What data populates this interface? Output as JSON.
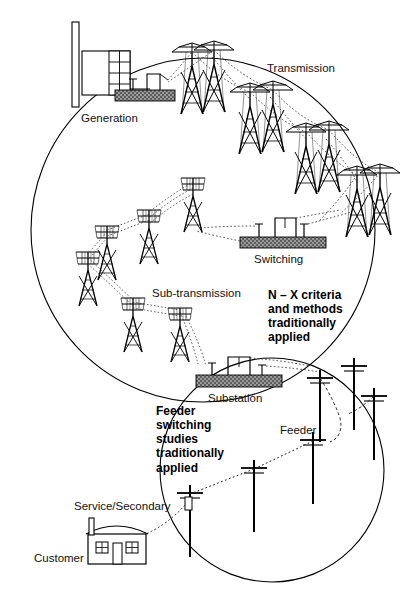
{
  "diagram": {
    "title_absent": true,
    "type": "electric-power-system-hierarchy",
    "labels": {
      "generation": "Generation",
      "transmission": "Transmission",
      "switching": "Switching",
      "sub_transmission": "Sub-transmission",
      "substation": "Substation",
      "feeder": "Feeder",
      "service_secondary": "Service/Secondary",
      "customer": "Customer"
    },
    "callouts": {
      "bulk": "N – X criteria\nand methods\ntraditionally\napplied",
      "distribution": "Feeder\nswitching\nstudies\ntraditionally\napplied"
    },
    "regions": [
      {
        "name": "bulk-power-system-circle",
        "cx": 203,
        "cy": 230,
        "r": 172
      },
      {
        "name": "distribution-system-circle",
        "cx": 272,
        "cy": 470,
        "r": 112
      }
    ],
    "icons": {
      "power_plant": "power-plant-icon",
      "transmission_tower": "transmission-tower-icon",
      "subtransmission_tower": "subtransmission-tower-icon",
      "switching_station": "switching-station-icon",
      "substation": "substation-icon",
      "distribution_pole": "distribution-pole-icon",
      "house": "customer-house-icon"
    },
    "colors": {
      "line": "#000000",
      "yard_fill": "#8c8c8c",
      "conductor": "#333333",
      "text": "#111111"
    }
  }
}
